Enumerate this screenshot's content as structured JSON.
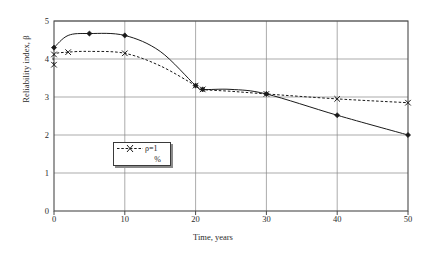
{
  "chart_data": {
    "type": "line",
    "title": "",
    "xlabel": "Time, years",
    "ylabel": "Reliability index, β",
    "xlim": [
      0,
      50
    ],
    "ylim": [
      0,
      5
    ],
    "xticks": [
      "0",
      "10",
      "20",
      "30",
      "40",
      "50"
    ],
    "yticks": [
      "0",
      "1",
      "2",
      "3",
      "4",
      "5"
    ],
    "grid": true,
    "legend_position": "inside-lower-left",
    "series": [
      {
        "name": "ρ=1",
        "style": "solid",
        "marker": "diamond",
        "color": "#1a1a1a",
        "x": [
          0,
          2,
          5,
          10,
          15,
          20,
          21,
          25,
          30,
          40,
          50
        ],
        "values": [
          4.3,
          4.62,
          4.67,
          4.62,
          4.2,
          3.3,
          3.2,
          3.2,
          3.08,
          2.52,
          2.0
        ]
      },
      {
        "name": "%",
        "style": "dashed",
        "marker": "cross",
        "color": "#1a1a1a",
        "x": [
          0,
          0,
          2,
          5,
          10,
          15,
          20,
          21,
          25,
          30,
          40,
          50
        ],
        "values": [
          3.85,
          4.12,
          4.18,
          4.2,
          4.15,
          3.82,
          3.3,
          3.2,
          3.15,
          3.08,
          2.95,
          2.85
        ]
      }
    ]
  },
  "legend": {
    "entry_1": "ρ=1",
    "entry_2": "%"
  },
  "axis": {
    "x_label": "Time, years",
    "y_label": "Reliability index, β"
  }
}
